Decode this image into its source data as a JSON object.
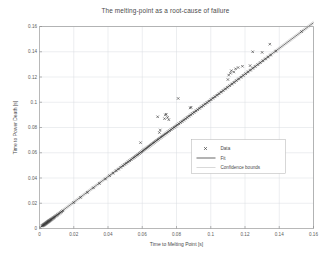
{
  "chart_data": {
    "type": "scatter",
    "title": "The melting-point as a root-cause of failure",
    "xlabel": "Time to Melting Point [s]",
    "ylabel": "Time to Power Death [s]",
    "xlim": [
      0,
      0.16
    ],
    "ylim": [
      0,
      0.16
    ],
    "xticks": [
      "0",
      "0.02",
      "0.04",
      "0.06",
      "0.08",
      "0.1",
      "0.12",
      "0.14",
      "0.16"
    ],
    "yticks": [
      "0",
      "0.02",
      "0.04",
      "0.06",
      "0.08",
      "0.1",
      "0.12",
      "0.14",
      "0.16"
    ],
    "xtick_values": [
      0,
      0.02,
      0.04,
      0.06,
      0.08,
      0.1,
      0.12,
      0.14,
      0.16
    ],
    "ytick_values": [
      0,
      0.02,
      0.04,
      0.06,
      0.08,
      0.1,
      0.12,
      0.14,
      0.16
    ],
    "grid": true,
    "legend_position": "center-right",
    "series": [
      {
        "name": "Data",
        "type": "scatter",
        "marker": "x",
        "color": "#3d3d3d",
        "points": [
          [
            0.0015,
            0.002
          ],
          [
            0.0018,
            0.0022
          ],
          [
            0.002,
            0.0024
          ],
          [
            0.0022,
            0.0026
          ],
          [
            0.0024,
            0.0027
          ],
          [
            0.0025,
            0.0029
          ],
          [
            0.0027,
            0.003
          ],
          [
            0.0028,
            0.0032
          ],
          [
            0.003,
            0.0033
          ],
          [
            0.0031,
            0.0035
          ],
          [
            0.0033,
            0.0036
          ],
          [
            0.0034,
            0.0038
          ],
          [
            0.0036,
            0.0039
          ],
          [
            0.0037,
            0.0041
          ],
          [
            0.0039,
            0.0042
          ],
          [
            0.004,
            0.0044
          ],
          [
            0.0042,
            0.0045
          ],
          [
            0.0043,
            0.0047
          ],
          [
            0.0045,
            0.0048
          ],
          [
            0.0046,
            0.005
          ],
          [
            0.0048,
            0.0051
          ],
          [
            0.0049,
            0.0053
          ],
          [
            0.0051,
            0.0054
          ],
          [
            0.0052,
            0.0056
          ],
          [
            0.0054,
            0.0057
          ],
          [
            0.0055,
            0.0059
          ],
          [
            0.0057,
            0.006
          ],
          [
            0.0058,
            0.0062
          ],
          [
            0.006,
            0.0063
          ],
          [
            0.0062,
            0.0065
          ],
          [
            0.0064,
            0.0067
          ],
          [
            0.0066,
            0.0069
          ],
          [
            0.0068,
            0.0071
          ],
          [
            0.007,
            0.0073
          ],
          [
            0.0072,
            0.0075
          ],
          [
            0.0075,
            0.0078
          ],
          [
            0.0078,
            0.0081
          ],
          [
            0.008,
            0.0083
          ],
          [
            0.0083,
            0.0086
          ],
          [
            0.0086,
            0.0089
          ],
          [
            0.009,
            0.0093
          ],
          [
            0.0094,
            0.0097
          ],
          [
            0.0098,
            0.0101
          ],
          [
            0.0102,
            0.0105
          ],
          [
            0.0107,
            0.011
          ],
          [
            0.0112,
            0.0115
          ],
          [
            0.0118,
            0.0121
          ],
          [
            0.0124,
            0.0127
          ],
          [
            0.013,
            0.0133
          ],
          [
            0.0137,
            0.014
          ],
          [
            0.02,
            0.0205
          ],
          [
            0.024,
            0.0246
          ],
          [
            0.028,
            0.0286
          ],
          [
            0.0315,
            0.0322
          ],
          [
            0.035,
            0.0357
          ],
          [
            0.0385,
            0.0392
          ],
          [
            0.041,
            0.0418
          ],
          [
            0.043,
            0.0438
          ],
          [
            0.0448,
            0.0457
          ],
          [
            0.0462,
            0.047
          ],
          [
            0.0475,
            0.0484
          ],
          [
            0.0488,
            0.0496
          ],
          [
            0.0498,
            0.0507
          ],
          [
            0.0508,
            0.0517
          ],
          [
            0.0518,
            0.0527
          ],
          [
            0.0527,
            0.0536
          ],
          [
            0.0536,
            0.0545
          ],
          [
            0.0545,
            0.0555
          ],
          [
            0.0553,
            0.0563
          ],
          [
            0.0561,
            0.0571
          ],
          [
            0.0569,
            0.0579
          ],
          [
            0.0576,
            0.0586
          ],
          [
            0.0584,
            0.0594
          ],
          [
            0.0591,
            0.0601
          ],
          [
            0.0598,
            0.0608
          ],
          [
            0.0605,
            0.0616
          ],
          [
            0.0612,
            0.0623
          ],
          [
            0.0619,
            0.063
          ],
          [
            0.0626,
            0.0637
          ],
          [
            0.0633,
            0.0644
          ],
          [
            0.059,
            0.068
          ],
          [
            0.064,
            0.0651
          ],
          [
            0.0648,
            0.0659
          ],
          [
            0.0655,
            0.0667
          ],
          [
            0.0663,
            0.0675
          ],
          [
            0.067,
            0.0682
          ],
          [
            0.0678,
            0.069
          ],
          [
            0.0686,
            0.0698
          ],
          [
            0.0694,
            0.0706
          ],
          [
            0.0702,
            0.0714
          ],
          [
            0.071,
            0.0723
          ],
          [
            0.07,
            0.076
          ],
          [
            0.0705,
            0.078
          ],
          [
            0.0718,
            0.0731
          ],
          [
            0.0726,
            0.0739
          ],
          [
            0.0735,
            0.0748
          ],
          [
            0.0743,
            0.0756
          ],
          [
            0.0752,
            0.0765
          ],
          [
            0.076,
            0.0774
          ],
          [
            0.069,
            0.0885
          ],
          [
            0.073,
            0.087
          ],
          [
            0.0735,
            0.09
          ],
          [
            0.074,
            0.0905
          ],
          [
            0.0748,
            0.088
          ],
          [
            0.0755,
            0.0862
          ],
          [
            0.0769,
            0.0783
          ],
          [
            0.0778,
            0.0792
          ],
          [
            0.0787,
            0.0801
          ],
          [
            0.0796,
            0.081
          ],
          [
            0.0805,
            0.082
          ],
          [
            0.0814,
            0.0829
          ],
          [
            0.0824,
            0.0839
          ],
          [
            0.0833,
            0.0848
          ],
          [
            0.0843,
            0.0858
          ],
          [
            0.081,
            0.103
          ],
          [
            0.0853,
            0.0868
          ],
          [
            0.0863,
            0.0879
          ],
          [
            0.0873,
            0.0889
          ],
          [
            0.0883,
            0.0899
          ],
          [
            0.0893,
            0.091
          ],
          [
            0.088,
            0.0955
          ],
          [
            0.0885,
            0.096
          ],
          [
            0.0903,
            0.092
          ],
          [
            0.0914,
            0.0931
          ],
          [
            0.0924,
            0.0941
          ],
          [
            0.0935,
            0.0952
          ],
          [
            0.0946,
            0.0963
          ],
          [
            0.0957,
            0.0974
          ],
          [
            0.0968,
            0.0986
          ],
          [
            0.0979,
            0.0997
          ],
          [
            0.099,
            0.1008
          ],
          [
            0.1002,
            0.102
          ],
          [
            0.1013,
            0.1032
          ],
          [
            0.1025,
            0.1043
          ],
          [
            0.1037,
            0.1055
          ],
          [
            0.1049,
            0.1067
          ],
          [
            0.1061,
            0.108
          ],
          [
            0.1073,
            0.1092
          ],
          [
            0.1086,
            0.1105
          ],
          [
            0.1098,
            0.1118
          ],
          [
            0.11,
            0.118
          ],
          [
            0.1105,
            0.1215
          ],
          [
            0.1111,
            0.1131
          ],
          [
            0.1115,
            0.123
          ],
          [
            0.112,
            0.125
          ],
          [
            0.1124,
            0.1144
          ],
          [
            0.1137,
            0.1157
          ],
          [
            0.1135,
            0.124
          ],
          [
            0.115,
            0.1171
          ],
          [
            0.1145,
            0.1265
          ],
          [
            0.1163,
            0.1184
          ],
          [
            0.116,
            0.1275
          ],
          [
            0.1177,
            0.1198
          ],
          [
            0.119,
            0.1212
          ],
          [
            0.1185,
            0.1285
          ],
          [
            0.1204,
            0.1226
          ],
          [
            0.1218,
            0.124
          ],
          [
            0.1232,
            0.1254
          ],
          [
            0.1246,
            0.1269
          ],
          [
            0.123,
            0.129
          ],
          [
            0.126,
            0.1283
          ],
          [
            0.1245,
            0.14
          ],
          [
            0.1275,
            0.1298
          ],
          [
            0.129,
            0.1313
          ],
          [
            0.13,
            0.1395
          ],
          [
            0.1305,
            0.1328
          ],
          [
            0.132,
            0.1343
          ],
          [
            0.1335,
            0.1358
          ],
          [
            0.135,
            0.1374
          ],
          [
            0.1345,
            0.146
          ],
          [
            0.138,
            0.1405
          ],
          [
            0.153,
            0.156
          ]
        ]
      },
      {
        "name": "Fit",
        "type": "line",
        "color": "#4d4d4d",
        "x": [
          0.0,
          0.16
        ],
        "y": [
          0.0005,
          0.163
        ],
        "slope": 1.0156,
        "intercept": 0.0005
      },
      {
        "name": "Confidence bounds",
        "type": "line",
        "color": "#b9b9b9",
        "offset": 0.0012
      }
    ],
    "legend": [
      {
        "label": "Data",
        "glyph": "marker",
        "color": "#3d3d3d"
      },
      {
        "label": "Fit",
        "glyph": "line",
        "color": "#4d4d4d"
      },
      {
        "label": "Confidence bounds",
        "glyph": "line",
        "color": "#b9b9b9"
      }
    ]
  }
}
